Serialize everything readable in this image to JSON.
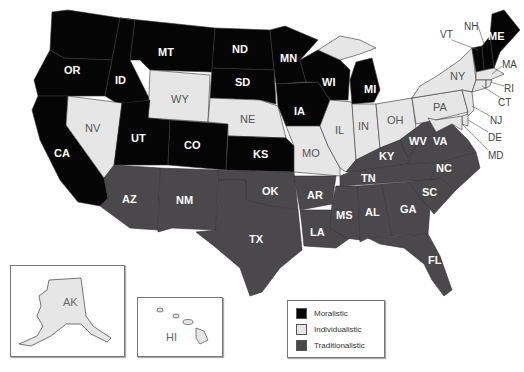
{
  "map": {
    "colors": {
      "moralistic": "#050505",
      "individualistic": "#e6e6e6",
      "traditionalistic": "#4a484b",
      "border": "#333333"
    },
    "states": {
      "WA": "WA",
      "OR": "OR",
      "CA": "CA",
      "ID": "ID",
      "MT": "MT",
      "WY": "WY",
      "NV": "NV",
      "UT": "UT",
      "CO": "CO",
      "AZ": "AZ",
      "NM": "NM",
      "ND": "ND",
      "SD": "SD",
      "NE": "NE",
      "KS": "KS",
      "OK": "OK",
      "TX": "TX",
      "MN": "MN",
      "IA": "IA",
      "MO": "MO",
      "AR": "AR",
      "LA": "LA",
      "WI": "WI",
      "IL": "IL",
      "MI": "MI",
      "IN": "IN",
      "OH": "OH",
      "KY": "KY",
      "TN": "TN",
      "MS": "MS",
      "AL": "AL",
      "GA": "GA",
      "FL": "FL",
      "SC": "SC",
      "NC": "NC",
      "VA": "VA",
      "WV": "WV",
      "PA": "PA",
      "NY": "NY",
      "VT": "VT",
      "NH": "NH",
      "ME": "ME",
      "MA": "MA",
      "RI": "RI",
      "CT": "CT",
      "NJ": "NJ",
      "DE": "DE",
      "MD": "MD",
      "AK": "AK",
      "HI": "HI"
    },
    "categories": {
      "moralistic": [
        "WA",
        "OR",
        "CA",
        "ID",
        "MT",
        "UT",
        "CO",
        "ND",
        "SD",
        "KS",
        "MN",
        "IA",
        "WI",
        "MI",
        "ME",
        "NH",
        "VT"
      ],
      "individualistic": [
        "WY",
        "NV",
        "NE",
        "MO",
        "IL",
        "IN",
        "OH",
        "PA",
        "NY",
        "MA",
        "RI",
        "CT",
        "NJ",
        "DE",
        "MD",
        "AK",
        "HI"
      ],
      "traditionalistic": [
        "AZ",
        "NM",
        "OK",
        "TX",
        "AR",
        "LA",
        "MS",
        "AL",
        "GA",
        "FL",
        "SC",
        "NC",
        "VA",
        "WV",
        "KY",
        "TN"
      ]
    }
  },
  "legend": {
    "items": [
      {
        "label": "Moralistic",
        "color": "#050505"
      },
      {
        "label": "Individualistic",
        "color": "#e6e6e6"
      },
      {
        "label": "Traditionalistic",
        "color": "#4a484b"
      }
    ]
  }
}
